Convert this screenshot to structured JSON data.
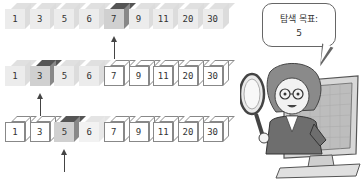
{
  "diagram": {
    "array": [
      "1",
      "3",
      "5",
      "6",
      "7",
      "9",
      "11",
      "20",
      "30"
    ],
    "rows": [
      {
        "step": 1,
        "pointer_index": 4,
        "cells": [
          {
            "value": "1",
            "state": "faded"
          },
          {
            "value": "3",
            "state": "faded"
          },
          {
            "value": "5",
            "state": "faded"
          },
          {
            "value": "6",
            "state": "faded"
          },
          {
            "value": "7",
            "state": "active"
          },
          {
            "value": "9",
            "state": "faded"
          },
          {
            "value": "11",
            "state": "faded"
          },
          {
            "value": "20",
            "state": "faded"
          },
          {
            "value": "30",
            "state": "faded"
          }
        ]
      },
      {
        "step": 2,
        "pointer_index": 1,
        "cells": [
          {
            "value": "1",
            "state": "faded"
          },
          {
            "value": "3",
            "state": "active"
          },
          {
            "value": "5",
            "state": "faded"
          },
          {
            "value": "6",
            "state": "faded"
          },
          {
            "value": "7",
            "state": "outline"
          },
          {
            "value": "9",
            "state": "outline"
          },
          {
            "value": "11",
            "state": "outline"
          },
          {
            "value": "20",
            "state": "outline"
          },
          {
            "value": "30",
            "state": "outline"
          }
        ]
      },
      {
        "step": 3,
        "pointer_index": 2,
        "cells": [
          {
            "value": "1",
            "state": "outline"
          },
          {
            "value": "3",
            "state": "outline"
          },
          {
            "value": "5",
            "state": "active"
          },
          {
            "value": "6",
            "state": "fadedlight"
          },
          {
            "value": "7",
            "state": "outline"
          },
          {
            "value": "9",
            "state": "outline"
          },
          {
            "value": "11",
            "state": "outline"
          },
          {
            "value": "20",
            "state": "outline"
          },
          {
            "value": "30",
            "state": "outline"
          }
        ]
      }
    ],
    "speech_bubble": {
      "line1": "탐색 목표:",
      "line2": "5"
    },
    "character": "woman-with-magnifying-glass-in-monitor"
  }
}
